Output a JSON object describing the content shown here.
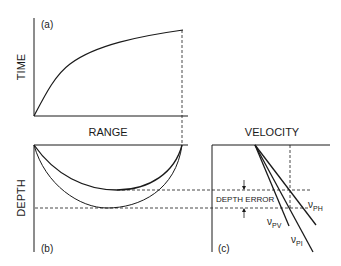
{
  "panels": {
    "a": {
      "tag": "(a)",
      "ylabel": "TIME",
      "xlabel": "RANGE"
    },
    "b": {
      "tag": "(b)",
      "ylabel": "DEPTH"
    },
    "c": {
      "tag": "(c)",
      "xlabel": "VELOCITY",
      "annotation": "DEPTH ERROR"
    }
  },
  "velocity_lines": [
    {
      "symbol": "ν",
      "sub": "PH"
    },
    {
      "symbol": "ν",
      "sub": "PV"
    },
    {
      "symbol": "ν",
      "sub": "PI"
    }
  ],
  "colors": {
    "ink": "#1a1a1a",
    "background": "#ffffff"
  }
}
